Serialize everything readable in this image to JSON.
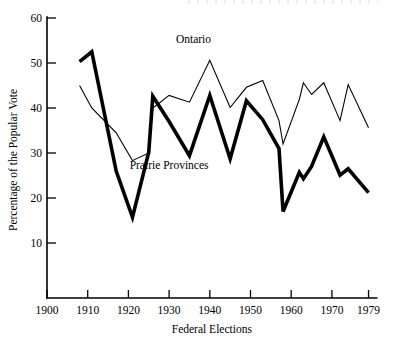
{
  "chart_data": {
    "type": "line",
    "title": "",
    "xlabel": "Federal Elections",
    "ylabel": "Percentage of the Popular Vote",
    "xlim": [
      1900,
      1981
    ],
    "ylim": [
      0,
      60
    ],
    "xticks": [
      1900,
      1910,
      1920,
      1930,
      1940,
      1950,
      1960,
      1970,
      1979
    ],
    "xtick_labels": [
      "1900",
      "1910",
      "1920",
      "1930",
      "1940",
      "1950",
      "1960",
      "1970",
      "1979"
    ],
    "yticks": [
      10,
      20,
      30,
      40,
      50,
      60
    ],
    "ytick_labels": [
      "10",
      "20",
      "30",
      "40",
      "50",
      "60"
    ],
    "grid": false,
    "legend_position": "inline-annotation",
    "series": [
      {
        "name": "Ontario",
        "style": "thin",
        "x": [
          1908,
          1911,
          1917,
          1921,
          1925,
          1926,
          1930,
          1935,
          1940,
          1945,
          1949,
          1953,
          1957,
          1958,
          1962,
          1963,
          1965,
          1968,
          1972,
          1974,
          1979
        ],
        "values": [
          45.0,
          40.0,
          34.5,
          28.3,
          30.0,
          40.0,
          42.8,
          41.3,
          50.6,
          40.1,
          44.6,
          46.1,
          37.2,
          32.0,
          41.9,
          45.6,
          43.0,
          45.6,
          37.2,
          45.2,
          35.6
        ]
      },
      {
        "name": "Prairie Provinces",
        "style": "thick",
        "x": [
          1908,
          1911,
          1917,
          1921,
          1925,
          1926,
          1930,
          1935,
          1940,
          1945,
          1949,
          1953,
          1957,
          1958,
          1962,
          1963,
          1965,
          1968,
          1972,
          1974,
          1979
        ],
        "values": [
          50.3,
          52.5,
          26.0,
          15.7,
          30.2,
          42.6,
          37.0,
          29.4,
          42.8,
          28.7,
          41.6,
          37.4,
          31.0,
          17.0,
          25.7,
          24.3,
          27.0,
          33.6,
          25.1,
          26.5,
          21.2
        ]
      }
    ],
    "annotations": [
      {
        "text": "Ontario",
        "x": 1936,
        "y": 54.5
      },
      {
        "text": "Prairie Provinces",
        "x": 1930,
        "y": 26.5
      }
    ]
  },
  "axes": {
    "y_axis_title": "Percentage of the Popular Vote",
    "x_axis_title": "Federal Elections"
  }
}
